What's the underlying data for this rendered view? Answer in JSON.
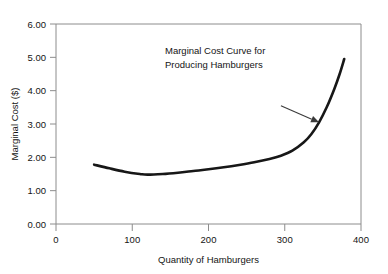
{
  "chart_data": {
    "type": "line",
    "title": "",
    "xlabel": "Quantity of Hamburgers",
    "ylabel": "Marginal Cost ($)",
    "xlim": [
      0,
      400
    ],
    "ylim": [
      0.0,
      6.0
    ],
    "xticks": [
      0,
      100,
      200,
      300,
      400
    ],
    "xtick_labels": [
      "0",
      "100",
      "200",
      "300",
      "400"
    ],
    "yticks": [
      0.0,
      1.0,
      2.0,
      3.0,
      4.0,
      5.0,
      6.0
    ],
    "ytick_labels": [
      "0.00",
      "1.00",
      "2.00",
      "3.00",
      "4.00",
      "5.00",
      "6.00"
    ],
    "grid": false,
    "legend": false,
    "series": [
      {
        "name": "Marginal Cost Curve for Producing Hamburgers",
        "color": "#171717",
        "x": [
          50,
          70,
          90,
          110,
          120,
          140,
          160,
          180,
          200,
          220,
          240,
          260,
          280,
          295,
          310,
          325,
          335,
          345,
          355,
          365,
          372,
          378
        ],
        "values": [
          1.78,
          1.67,
          1.57,
          1.5,
          1.48,
          1.5,
          1.54,
          1.59,
          1.64,
          1.7,
          1.77,
          1.85,
          1.95,
          2.05,
          2.2,
          2.45,
          2.7,
          3.05,
          3.5,
          4.05,
          4.5,
          4.95
        ]
      }
    ],
    "annotations": [
      {
        "name": "curve-callout",
        "line1": "Marginal Cost Curve for",
        "line2": "Producing Hamburgers",
        "arrow_from": [
          295,
          3.55
        ],
        "arrow_to": [
          345,
          3.05
        ]
      }
    ]
  },
  "colors": {
    "curve": "#171717",
    "axis": "#8c8c8c",
    "text": "#141414",
    "leader": "#3a3a3a",
    "background": "#ffffff"
  }
}
